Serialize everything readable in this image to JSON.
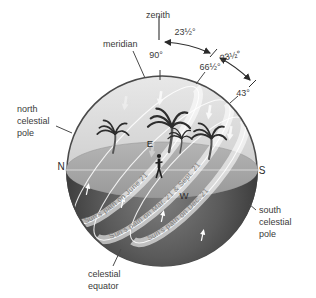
{
  "figure": {
    "type": "celestial sphere sun path diagram",
    "zenith": "zenith",
    "meridian": "meridian",
    "angles": {
      "zenith_altitude": "90°",
      "june_noon_altitude": "66½°",
      "equinox_noon_altitude": "43°",
      "obliquity_upper": "23½°",
      "obliquity_lower": "23½°"
    },
    "poles": {
      "north": [
        "north",
        "celestial",
        "pole"
      ],
      "south": [
        "south",
        "celestial",
        "pole"
      ]
    },
    "equator": [
      "celestial",
      "equator"
    ],
    "compass": {
      "north": "N",
      "south": "S",
      "east": "E",
      "west": "W"
    },
    "sun_paths": [
      {
        "label": "Sun's path on June 21"
      },
      {
        "label": "Sun's path on Mar. 21 & Sept. 21"
      },
      {
        "label": "Sun's path on Dec. 21"
      }
    ],
    "colors": {
      "sky": "#d9d9d9",
      "ground": "#a8a8a8",
      "below_horizon": "#474747",
      "sun_path_band": "#ffffff",
      "ink": "#3a3a3a",
      "path_text": "#7e7e7e"
    }
  }
}
